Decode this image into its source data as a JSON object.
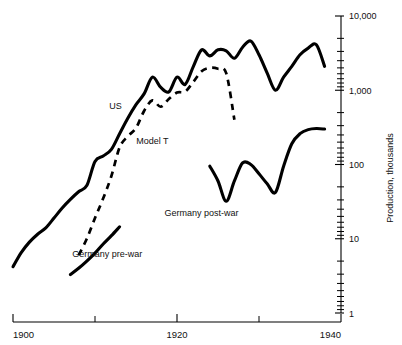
{
  "chart_data": {
    "type": "line",
    "title": "",
    "subtitle": "",
    "xlabel": "",
    "ylabel": "Production, thousands",
    "yscale": "log",
    "ylim": [
      1,
      10000
    ],
    "xlim": [
      1900,
      1940
    ],
    "grid": false,
    "legend_position": "inline-annotations",
    "y_tick_labels": [
      "10,000",
      "1,000",
      "100",
      "10",
      "1"
    ],
    "y_tick_values": [
      10000,
      1000,
      100,
      10,
      1
    ],
    "x_tick_labels": [
      "1900",
      "1920",
      "1940"
    ],
    "x_tick_values": [
      1900,
      1920,
      1940
    ],
    "x_minor_ticks": [
      1910,
      1930
    ],
    "series": [
      {
        "name": "US",
        "style": "solid",
        "label_text": "US",
        "x": [
          1900,
          1901,
          1902,
          1903,
          1904,
          1905,
          1906,
          1907,
          1908,
          1909,
          1910,
          1911,
          1912,
          1913,
          1914,
          1915,
          1916,
          1917,
          1918,
          1919,
          1920,
          1921,
          1922,
          1923,
          1924,
          1925,
          1926,
          1927,
          1928,
          1929,
          1930,
          1931,
          1932,
          1933,
          1934,
          1935,
          1936,
          1937,
          1938
        ],
        "values": [
          4.2,
          6.5,
          9.0,
          11.5,
          14.0,
          19.0,
          26.0,
          34.0,
          43.0,
          52.0,
          110.0,
          130.0,
          160.0,
          260.0,
          420.0,
          640.0,
          900.0,
          1500.0,
          1100.0,
          950.0,
          1500.0,
          1200.0,
          2100.0,
          3500.0,
          2900.0,
          3500.0,
          3400.0,
          2700.0,
          3800.0,
          4600.0,
          3000.0,
          1700.0,
          1000.0,
          1500.0,
          2100.0,
          3000.0,
          3700.0,
          4100.0,
          2100.0
        ]
      },
      {
        "name": "Model T",
        "style": "dashed",
        "label_text": "Model T",
        "x": [
          1908,
          1909,
          1910,
          1911,
          1912,
          1913,
          1914,
          1915,
          1916,
          1917,
          1918,
          1919,
          1920,
          1921,
          1922,
          1923,
          1924,
          1925,
          1926,
          1927
        ],
        "values": [
          6.0,
          10.0,
          19.0,
          35.0,
          70.0,
          170.0,
          240.0,
          310.0,
          530.0,
          730.0,
          600.0,
          760.0,
          930.0,
          960.0,
          1300.0,
          1800.0,
          2000.0,
          1950.0,
          1700.0,
          400.0
        ]
      },
      {
        "name": "Germany pre-war",
        "style": "solid",
        "label_text": "Germany pre-war",
        "x": [
          1907,
          1908,
          1909,
          1910,
          1911,
          1912,
          1913
        ],
        "values": [
          3.3,
          4.0,
          5.0,
          6.4,
          8.5,
          11.0,
          14.5
        ]
      },
      {
        "name": "Germany post-war",
        "style": "solid",
        "label_text": "Germany post-war",
        "x": [
          1924,
          1925,
          1926,
          1927,
          1928,
          1929,
          1930,
          1931,
          1932,
          1933,
          1934,
          1935,
          1936,
          1937,
          1938
        ],
        "values": [
          95.0,
          60.0,
          32.0,
          60.0,
          105.0,
          100.0,
          75.0,
          55.0,
          42.0,
          95.0,
          190.0,
          260.0,
          295.0,
          305.0,
          300.0
        ]
      }
    ],
    "annotations": [
      {
        "text": "US",
        "x": 1912.5,
        "y": 560
      },
      {
        "text": "Model T",
        "x": 1917.0,
        "y": 190
      },
      {
        "text": "Germany pre-war",
        "x": 1911.5,
        "y": 5.6
      },
      {
        "text": "Germany post-war",
        "x": 1923.0,
        "y": 20
      }
    ]
  }
}
